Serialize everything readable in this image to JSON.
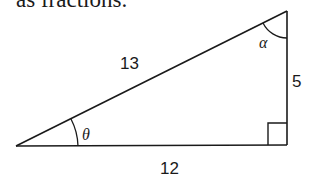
{
  "intro_text": "as fractions.",
  "triangle": {
    "hypotenuse_label": "13",
    "vertical_leg_label": "5",
    "horizontal_leg_label": "12",
    "angle_bottom_left_label": "θ",
    "angle_top_right_label": "α",
    "right_angle_marker": "right-angle-square",
    "stroke_color": "#1a1a1a"
  }
}
